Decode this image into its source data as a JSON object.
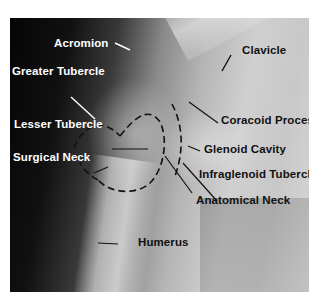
{
  "figure": {
    "labels": [
      {
        "id": "acromion",
        "text": "Acromion"
      },
      {
        "id": "greater-tubercle",
        "text": "Greater Tubercle"
      },
      {
        "id": "lesser-tubercle",
        "text": "Lesser Tubercle"
      },
      {
        "id": "surgical-neck",
        "text": "Surgical Neck"
      },
      {
        "id": "clavicle",
        "text": "Clavicle"
      },
      {
        "id": "coracoid-process",
        "text": "Coracoid Process"
      },
      {
        "id": "glenoid-cavity",
        "text": "Glenoid Cavity"
      },
      {
        "id": "infraglenoid-tubercle",
        "text": "Infraglenoid Tubercle"
      },
      {
        "id": "anatomical-neck",
        "text": "Anatomical Neck"
      },
      {
        "id": "humerus",
        "text": "Humerus"
      }
    ]
  }
}
